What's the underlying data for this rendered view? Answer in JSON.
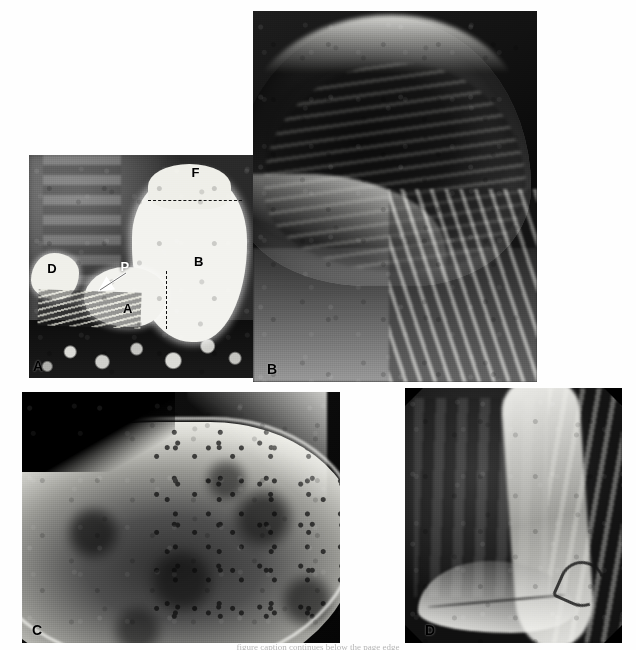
{
  "figure": {
    "caption_truncated": "figure caption continues below the page edge"
  },
  "panels": [
    {
      "id": "A",
      "letter": "A",
      "name": "overview-barium-stomach",
      "description": "Full-field double-contrast barium study showing duodenal bulb, antrum, body and fundus with air-fluid level",
      "annotations": [
        {
          "label": "F",
          "meaning": "fundus",
          "x_pct": 72,
          "y_pct": 8
        },
        {
          "label": "B",
          "meaning": "body",
          "x_pct": 73,
          "y_pct": 46
        },
        {
          "label": "A",
          "meaning": "antrum",
          "x_pct": 42,
          "y_pct": 67
        },
        {
          "label": "D",
          "meaning": "duodenal-bulb",
          "x_pct": 9,
          "y_pct": 50
        },
        {
          "label": "P",
          "meaning": "pylorus",
          "x_pct": 40,
          "y_pct": 50
        }
      ],
      "markers": [
        {
          "type": "dashed-line",
          "orientation": "horizontal",
          "meaning": "air-fluid level at fundus"
        },
        {
          "type": "dashed-line",
          "orientation": "vertical",
          "meaning": "antrum-body boundary"
        },
        {
          "type": "arrow",
          "meaning": "pylorus pointer",
          "direction": "down-left"
        }
      ]
    },
    {
      "id": "B",
      "letter": "B",
      "name": "magnified-fundus-cardia",
      "description": "Magnified view of gastric fundus and cardia with rugal folds and left hemidiaphragm"
    },
    {
      "id": "C",
      "letter": "C",
      "name": "magnified-body-greater-curvature",
      "description": "Magnified view of gastric body with incisura angularis and mottled mucosal pattern along the greater curvature"
    },
    {
      "id": "D",
      "letter": "D",
      "name": "magnified-antrum-duodenum",
      "description": "Magnified view of gastric antrum, pyloric channel and duodenal bulb"
    }
  ],
  "colors": {
    "background": "#ffffff",
    "barium": "#f2f2ee",
    "film_black": "#0a0a0a",
    "label_text": "#000000",
    "label_text_light": "#ffffff"
  }
}
